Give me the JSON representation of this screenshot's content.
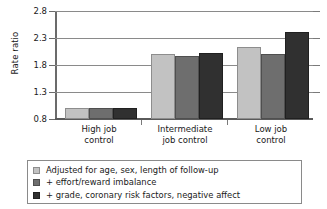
{
  "chart_data": {
    "type": "bar",
    "title": "",
    "xlabel": "",
    "ylabel": "Rate ratio",
    "categories": [
      "High job control",
      "Intermediate job control",
      "Low job control"
    ],
    "category_lines": [
      [
        "High job",
        "control"
      ],
      [
        "Intermediate",
        "job control"
      ],
      [
        "Low job",
        "control"
      ]
    ],
    "series": [
      {
        "name": "Adjusted for age, sex, length of follow-up",
        "color": "#c2c2c2",
        "values": [
          1.0,
          2.02,
          2.15
        ]
      },
      {
        "name": "+ effort/reward imbalance",
        "color": "#6e6e6e",
        "values": [
          1.0,
          1.98,
          2.02
        ]
      },
      {
        "name": "+ grade, coronary risk factors, negative affect",
        "color": "#303030",
        "values": [
          1.0,
          2.04,
          2.43
        ]
      }
    ],
    "ylim": [
      0.8,
      2.8
    ],
    "yticks": [
      "2.8",
      "2.3",
      "1.8",
      "1.3",
      "0.8"
    ],
    "ytick_values": [
      2.8,
      2.3,
      1.8,
      1.3,
      0.8
    ],
    "grid": true,
    "legend_position": "below"
  }
}
